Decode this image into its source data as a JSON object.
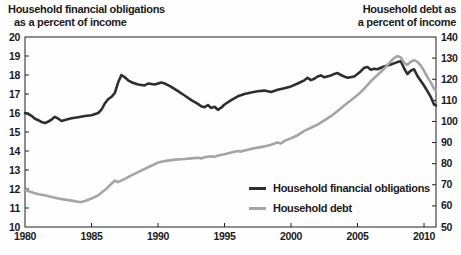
{
  "titles": {
    "left": {
      "line1": "Household financial obligations",
      "line2": "as a percent of income"
    },
    "right": {
      "line1": "Household debt as",
      "line2": "a percent of income"
    }
  },
  "colors": {
    "obligations_line": "#2e2d2f",
    "debt_line": "#a3a5a7",
    "axis": "#231f20",
    "text": "#1c1a1b"
  },
  "chart_data": {
    "type": "line",
    "title_left_axis": "Household financial obligations as a percent of income",
    "title_right_axis": "Household debt as a percent of income",
    "grid": false,
    "legend_position": "inside-lower-right",
    "x_axis": {
      "range": [
        1980,
        2010.9
      ],
      "tick_labels": [
        1980,
        1985,
        1990,
        1995,
        2000,
        2005,
        2010
      ]
    },
    "y_left_axis": {
      "range": [
        10,
        20
      ],
      "tick_labels": [
        10,
        11,
        12,
        13,
        14,
        15,
        16,
        17,
        18,
        19,
        20
      ]
    },
    "y_right_axis": {
      "range": [
        50,
        140
      ],
      "tick_labels": [
        50,
        60,
        70,
        80,
        90,
        100,
        110,
        120,
        130,
        140
      ]
    },
    "series": [
      {
        "name": "Household financial obligations",
        "axis": "left",
        "color": "#2e2d2f",
        "points": [
          [
            1980.0,
            16.0
          ],
          [
            1980.25,
            15.95
          ],
          [
            1980.5,
            15.85
          ],
          [
            1980.75,
            15.7
          ],
          [
            1981.0,
            15.62
          ],
          [
            1981.25,
            15.52
          ],
          [
            1981.5,
            15.47
          ],
          [
            1981.75,
            15.55
          ],
          [
            1982.0,
            15.65
          ],
          [
            1982.25,
            15.8
          ],
          [
            1982.5,
            15.7
          ],
          [
            1982.75,
            15.58
          ],
          [
            1983.0,
            15.63
          ],
          [
            1983.5,
            15.72
          ],
          [
            1984.0,
            15.78
          ],
          [
            1984.5,
            15.84
          ],
          [
            1985.0,
            15.88
          ],
          [
            1985.5,
            16.0
          ],
          [
            1985.75,
            16.18
          ],
          [
            1986.0,
            16.5
          ],
          [
            1986.25,
            16.72
          ],
          [
            1986.5,
            16.85
          ],
          [
            1986.75,
            17.05
          ],
          [
            1987.0,
            17.6
          ],
          [
            1987.25,
            18.0
          ],
          [
            1987.5,
            17.88
          ],
          [
            1987.75,
            17.72
          ],
          [
            1988.0,
            17.62
          ],
          [
            1988.5,
            17.5
          ],
          [
            1989.0,
            17.45
          ],
          [
            1989.25,
            17.55
          ],
          [
            1989.75,
            17.5
          ],
          [
            1990.25,
            17.6
          ],
          [
            1990.5,
            17.55
          ],
          [
            1991.0,
            17.38
          ],
          [
            1991.5,
            17.15
          ],
          [
            1992.0,
            16.92
          ],
          [
            1992.5,
            16.68
          ],
          [
            1993.0,
            16.48
          ],
          [
            1993.25,
            16.35
          ],
          [
            1993.5,
            16.3
          ],
          [
            1993.75,
            16.42
          ],
          [
            1994.0,
            16.27
          ],
          [
            1994.25,
            16.33
          ],
          [
            1994.5,
            16.17
          ],
          [
            1994.75,
            16.28
          ],
          [
            1995.0,
            16.45
          ],
          [
            1995.5,
            16.68
          ],
          [
            1996.0,
            16.88
          ],
          [
            1996.5,
            17.0
          ],
          [
            1997.0,
            17.08
          ],
          [
            1997.5,
            17.14
          ],
          [
            1998.0,
            17.18
          ],
          [
            1998.5,
            17.1
          ],
          [
            1999.0,
            17.22
          ],
          [
            1999.5,
            17.3
          ],
          [
            2000.0,
            17.4
          ],
          [
            2000.5,
            17.55
          ],
          [
            2001.0,
            17.72
          ],
          [
            2001.25,
            17.85
          ],
          [
            2001.5,
            17.73
          ],
          [
            2001.75,
            17.8
          ],
          [
            2002.0,
            17.92
          ],
          [
            2002.25,
            17.98
          ],
          [
            2002.5,
            17.88
          ],
          [
            2003.0,
            17.97
          ],
          [
            2003.25,
            18.06
          ],
          [
            2003.5,
            18.1
          ],
          [
            2003.75,
            18.0
          ],
          [
            2004.0,
            17.92
          ],
          [
            2004.25,
            17.86
          ],
          [
            2004.75,
            17.92
          ],
          [
            2005.0,
            18.05
          ],
          [
            2005.25,
            18.2
          ],
          [
            2005.5,
            18.38
          ],
          [
            2005.75,
            18.42
          ],
          [
            2006.0,
            18.28
          ],
          [
            2006.25,
            18.33
          ],
          [
            2006.5,
            18.3
          ],
          [
            2006.75,
            18.38
          ],
          [
            2007.0,
            18.45
          ],
          [
            2007.5,
            18.55
          ],
          [
            2008.0,
            18.68
          ],
          [
            2008.25,
            18.72
          ],
          [
            2008.5,
            18.35
          ],
          [
            2008.75,
            18.05
          ],
          [
            2009.0,
            18.22
          ],
          [
            2009.25,
            18.3
          ],
          [
            2009.5,
            17.95
          ],
          [
            2009.75,
            17.7
          ],
          [
            2010.0,
            17.45
          ],
          [
            2010.25,
            17.15
          ],
          [
            2010.5,
            16.85
          ],
          [
            2010.75,
            16.45
          ],
          [
            2010.9,
            16.4
          ]
        ]
      },
      {
        "name": "Household debt",
        "axis": "right",
        "color": "#a3a5a7",
        "points": [
          [
            1980.0,
            67.5
          ],
          [
            1980.5,
            66.5
          ],
          [
            1981.0,
            65.5
          ],
          [
            1981.5,
            65.0
          ],
          [
            1982.0,
            64.2
          ],
          [
            1982.5,
            63.5
          ],
          [
            1983.0,
            63.0
          ],
          [
            1983.5,
            62.5
          ],
          [
            1984.0,
            62.0
          ],
          [
            1984.25,
            61.8
          ],
          [
            1984.5,
            62.3
          ],
          [
            1985.0,
            63.5
          ],
          [
            1985.5,
            65.0
          ],
          [
            1986.0,
            67.5
          ],
          [
            1986.5,
            70.5
          ],
          [
            1986.75,
            72.0
          ],
          [
            1987.0,
            71.2
          ],
          [
            1987.5,
            72.8
          ],
          [
            1988.0,
            74.5
          ],
          [
            1988.5,
            76.0
          ],
          [
            1989.0,
            77.5
          ],
          [
            1989.5,
            79.0
          ],
          [
            1990.0,
            80.5
          ],
          [
            1990.5,
            81.2
          ],
          [
            1991.0,
            81.7
          ],
          [
            1991.5,
            82.0
          ],
          [
            1992.0,
            82.2
          ],
          [
            1992.5,
            82.5
          ],
          [
            1993.0,
            82.8
          ],
          [
            1993.25,
            82.5
          ],
          [
            1993.5,
            83.0
          ],
          [
            1994.0,
            83.5
          ],
          [
            1994.25,
            83.2
          ],
          [
            1994.5,
            83.8
          ],
          [
            1995.0,
            84.5
          ],
          [
            1995.5,
            85.3
          ],
          [
            1996.0,
            86.0
          ],
          [
            1996.25,
            85.7
          ],
          [
            1996.5,
            86.3
          ],
          [
            1997.0,
            87.0
          ],
          [
            1997.5,
            87.6
          ],
          [
            1998.0,
            88.2
          ],
          [
            1998.5,
            89.0
          ],
          [
            1999.0,
            90.0
          ],
          [
            1999.25,
            89.5
          ],
          [
            1999.5,
            90.8
          ],
          [
            2000.0,
            92.0
          ],
          [
            2000.5,
            93.5
          ],
          [
            2001.0,
            95.5
          ],
          [
            2001.5,
            97.0
          ],
          [
            2002.0,
            98.5
          ],
          [
            2002.5,
            100.5
          ],
          [
            2003.0,
            102.5
          ],
          [
            2003.5,
            105.0
          ],
          [
            2004.0,
            107.5
          ],
          [
            2004.5,
            110.0
          ],
          [
            2005.0,
            112.5
          ],
          [
            2005.5,
            115.5
          ],
          [
            2006.0,
            119.0
          ],
          [
            2006.5,
            122.0
          ],
          [
            2007.0,
            125.0
          ],
          [
            2007.5,
            128.5
          ],
          [
            2007.75,
            130.0
          ],
          [
            2008.0,
            131.0
          ],
          [
            2008.25,
            130.3
          ],
          [
            2008.5,
            127.8
          ],
          [
            2008.75,
            126.8
          ],
          [
            2009.0,
            128.3
          ],
          [
            2009.25,
            129.0
          ],
          [
            2009.5,
            128.2
          ],
          [
            2009.75,
            126.5
          ],
          [
            2010.0,
            124.0
          ],
          [
            2010.25,
            121.0
          ],
          [
            2010.5,
            118.5
          ],
          [
            2010.75,
            115.5
          ],
          [
            2010.9,
            114.5
          ]
        ]
      }
    ]
  }
}
